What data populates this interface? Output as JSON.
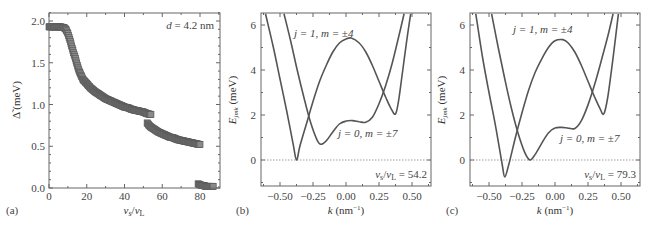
{
  "chart_data": [
    {
      "panel": "(a)",
      "type": "scatter",
      "title": "",
      "annotation": "d = 4.2 nm",
      "xlabel": "v_s/v_L",
      "ylabel": "Δ̃ (meV)",
      "xlim": [
        0,
        90
      ],
      "ylim": [
        0,
        2.1
      ],
      "xticks": [
        0,
        20,
        40,
        60,
        80
      ],
      "yticks": [
        "0.0",
        "0.5",
        "1.0",
        "1.5",
        "2.0"
      ],
      "grid": false,
      "marker": "square",
      "color": "#666666",
      "series": [
        {
          "name": "branch 1",
          "x": [
            0,
            2,
            4,
            6,
            8,
            9,
            10,
            11,
            12,
            13,
            14,
            15,
            16,
            17,
            18,
            20,
            22,
            24,
            26,
            28,
            30,
            32,
            34,
            36,
            38,
            40,
            42,
            44,
            46,
            48,
            50,
            52,
            54
          ],
          "y": [
            1.93,
            1.93,
            1.93,
            1.93,
            1.92,
            1.9,
            1.85,
            1.78,
            1.7,
            1.62,
            1.55,
            1.47,
            1.4,
            1.35,
            1.3,
            1.25,
            1.2,
            1.16,
            1.13,
            1.1,
            1.07,
            1.05,
            1.03,
            1.01,
            0.99,
            0.97,
            0.96,
            0.94,
            0.93,
            0.92,
            0.91,
            0.89,
            0.88
          ]
        },
        {
          "name": "branch 2",
          "x": [
            52,
            53,
            54,
            56,
            58,
            60,
            62,
            64,
            66,
            68,
            70,
            72,
            74,
            76,
            78,
            80
          ],
          "y": [
            0.78,
            0.75,
            0.73,
            0.7,
            0.67,
            0.65,
            0.63,
            0.61,
            0.6,
            0.58,
            0.57,
            0.56,
            0.55,
            0.54,
            0.53,
            0.52
          ]
        },
        {
          "name": "branch 3",
          "x": [
            79,
            80,
            81,
            82,
            83,
            84,
            85,
            86,
            87
          ],
          "y": [
            0.05,
            0.04,
            0.03,
            0.03,
            0.02,
            0.02,
            0.02,
            0.02,
            0.02
          ]
        }
      ]
    },
    {
      "panel": "(b)",
      "type": "line",
      "annotation": "v_s/v_L = 54.2",
      "xlabel": "k (nm⁻¹)",
      "ylabel": "E_jmk (meV)",
      "xlim": [
        -0.65,
        0.65
      ],
      "ylim": [
        -1.2,
        6.5
      ],
      "xticks": [
        "−0.50",
        "−0.25",
        "0.00",
        "0.25",
        "0.50"
      ],
      "yticks": [
        "0",
        "2",
        "4",
        "6"
      ],
      "grid": false,
      "zero_line": true,
      "series": [
        {
          "name": "j = 1, m = ±4",
          "x": [
            -0.61,
            -0.55,
            -0.5,
            -0.45,
            -0.4,
            -0.375,
            -0.35,
            -0.3,
            -0.25,
            -0.2,
            -0.15,
            -0.1,
            -0.05,
            0.0,
            0.04,
            0.1,
            0.15,
            0.2,
            0.25,
            0.3,
            0.34,
            0.375,
            0.4,
            0.43,
            0.46,
            0.49
          ],
          "y": [
            6.5,
            5.0,
            3.6,
            2.2,
            0.7,
            0.0,
            0.6,
            1.6,
            2.6,
            3.5,
            4.2,
            4.8,
            5.2,
            5.38,
            5.42,
            5.2,
            4.8,
            4.2,
            3.5,
            2.8,
            2.3,
            2.05,
            2.7,
            4.0,
            5.3,
            6.5
          ]
        },
        {
          "name": "j = 0, m = ±7",
          "x": [
            -0.47,
            -0.42,
            -0.37,
            -0.32,
            -0.27,
            -0.22,
            -0.19,
            -0.15,
            -0.1,
            -0.05,
            0.0,
            0.05,
            0.1,
            0.15,
            0.2,
            0.25,
            0.3,
            0.35,
            0.4,
            0.44
          ],
          "y": [
            6.5,
            5.3,
            4.0,
            2.8,
            1.7,
            0.9,
            0.7,
            0.85,
            1.25,
            1.6,
            1.73,
            1.75,
            1.7,
            1.68,
            1.9,
            2.5,
            3.3,
            4.3,
            5.5,
            6.5
          ]
        }
      ]
    },
    {
      "panel": "(c)",
      "type": "line",
      "annotation": "v_s/v_L = 79.3",
      "xlabel": "k (nm⁻¹)",
      "ylabel": "E_jmk (meV)",
      "xlim": [
        -0.65,
        0.65
      ],
      "ylim": [
        -1.2,
        6.5
      ],
      "xticks": [
        "−0.50",
        "−0.25",
        "0.00",
        "0.25",
        "0.50"
      ],
      "yticks": [
        "0",
        "2",
        "4",
        "6"
      ],
      "grid": false,
      "zero_line": true,
      "series": [
        {
          "name": "j = 1, m = ±4",
          "x": [
            -0.6,
            -0.55,
            -0.5,
            -0.45,
            -0.4,
            -0.38,
            -0.35,
            -0.3,
            -0.25,
            -0.2,
            -0.15,
            -0.1,
            -0.05,
            0.0,
            0.06,
            0.1,
            0.15,
            0.2,
            0.25,
            0.3,
            0.34,
            0.37,
            0.4,
            0.43,
            0.46,
            0.48
          ],
          "y": [
            6.5,
            4.6,
            3.0,
            1.5,
            -0.2,
            -0.75,
            -0.2,
            1.0,
            2.1,
            3.1,
            3.9,
            4.5,
            5.0,
            5.3,
            5.35,
            5.2,
            4.8,
            4.2,
            3.5,
            2.8,
            2.3,
            2.05,
            2.8,
            4.1,
            5.5,
            6.5
          ]
        },
        {
          "name": "j = 0, m = ±7",
          "x": [
            -0.48,
            -0.43,
            -0.38,
            -0.33,
            -0.28,
            -0.23,
            -0.19,
            -0.15,
            -0.1,
            -0.05,
            0.0,
            0.05,
            0.1,
            0.15,
            0.2,
            0.25,
            0.3,
            0.35,
            0.4,
            0.44
          ],
          "y": [
            6.5,
            5.0,
            3.6,
            2.3,
            1.2,
            0.35,
            0.0,
            0.25,
            0.75,
            1.2,
            1.42,
            1.45,
            1.42,
            1.4,
            1.75,
            2.45,
            3.35,
            4.4,
            5.5,
            6.5
          ]
        }
      ]
    }
  ],
  "panels": {
    "a": {
      "tag": "(a)",
      "annotation": "d = 4.2 nm",
      "ylabel_main": "Δ̃",
      "ylabel_unit": " (meV)",
      "xlabel_num": "v",
      "xlabel_sub1": "s",
      "xlabel_den": "v",
      "xlabel_sub2": "L"
    },
    "b": {
      "tag": "(b)",
      "annotation_val": " = 54.2",
      "label_upper": "j = 1, m = ±4",
      "label_lower": "j = 0, m = ±7"
    },
    "c": {
      "tag": "(c)",
      "annotation_val": " = 79.3",
      "label_upper": "j = 1, m = ±4",
      "label_lower": "j = 0, m = ±7"
    },
    "k_label": "k",
    "k_unit": " (nm",
    "k_exp": "−1",
    "k_close": ")",
    "E_main": "E",
    "E_sub": "jmk",
    "E_unit": " (meV)"
  }
}
